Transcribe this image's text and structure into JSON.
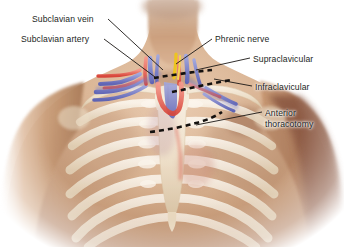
{
  "figure": {
    "kind": "anatomical-illustration",
    "background_color": "#ffffff"
  },
  "palette": {
    "skin_light": "#e4c3a6",
    "skin_mid": "#c79a76",
    "skin_shadow": "#9e6f51",
    "arm_shadow": "#8d5c45",
    "bone": "#f3ead9",
    "bone_shadow": "#ddcbb0",
    "artery": "#e2574a",
    "artery_light": "#f08a7c",
    "vein": "#6f74c0",
    "vein_light": "#9aa0d8",
    "nerve": "#edc420",
    "incision": "#14110f",
    "leader": "#1a1614",
    "text": "#231f1d"
  },
  "labels": [
    {
      "id": "subclavian-vein",
      "text": "Subclavian vein",
      "side": "left",
      "x": 32,
      "y": 14,
      "leader": {
        "x1": 108,
        "y1": 19,
        "x2": 163,
        "y2": 70
      }
    },
    {
      "id": "subclavian-artery",
      "text": "Subclavian artery",
      "side": "left",
      "x": 21,
      "y": 34,
      "leader": {
        "x1": 104,
        "y1": 39,
        "x2": 155,
        "y2": 77
      }
    },
    {
      "id": "phrenic-nerve",
      "text": "Phrenic nerve",
      "side": "right",
      "x": 215,
      "y": 34,
      "leader": {
        "x1": 212,
        "y1": 39,
        "x2": 176,
        "y2": 64
      }
    },
    {
      "id": "supraclavicular",
      "text": "Supraclavicular",
      "side": "right",
      "x": 253,
      "y": 54,
      "leader": {
        "x1": 250,
        "y1": 58,
        "x2": 196,
        "y2": 70
      }
    },
    {
      "id": "infraclavicular",
      "text": "Infraclavicular",
      "side": "right",
      "x": 255,
      "y": 82,
      "leader": {
        "x1": 252,
        "y1": 86,
        "x2": 214,
        "y2": 79
      }
    },
    {
      "id": "anterior-thoracotomy",
      "text": "Anterior\nthoracotomy",
      "side": "right",
      "x": 265,
      "y": 108,
      "leader": {
        "x1": 262,
        "y1": 112,
        "x2": 196,
        "y2": 125
      }
    }
  ],
  "incisions": [
    {
      "id": "supraclavicular-incision",
      "label": "Supraclavicular",
      "dash": "5,4"
    },
    {
      "id": "infraclavicular-incision",
      "label": "Infraclavicular",
      "dash": "5,4"
    },
    {
      "id": "anterior-thoracotomy-incision",
      "label": "Anterior thoracotomy",
      "dash": "5,4"
    }
  ],
  "structures": [
    {
      "id": "subclavian-vein",
      "color": "#6f74c0",
      "name": "Subclavian vein"
    },
    {
      "id": "subclavian-artery",
      "color": "#e2574a",
      "name": "Subclavian artery"
    },
    {
      "id": "phrenic-nerve",
      "color": "#edc420",
      "name": "Phrenic nerve"
    },
    {
      "id": "sternum",
      "color": "#f3ead9",
      "name": "Sternum"
    },
    {
      "id": "clavicle",
      "color": "#f3ead9",
      "name": "Clavicle"
    },
    {
      "id": "rib-cage",
      "color": "#f3ead9",
      "name": "Rib cage"
    }
  ]
}
